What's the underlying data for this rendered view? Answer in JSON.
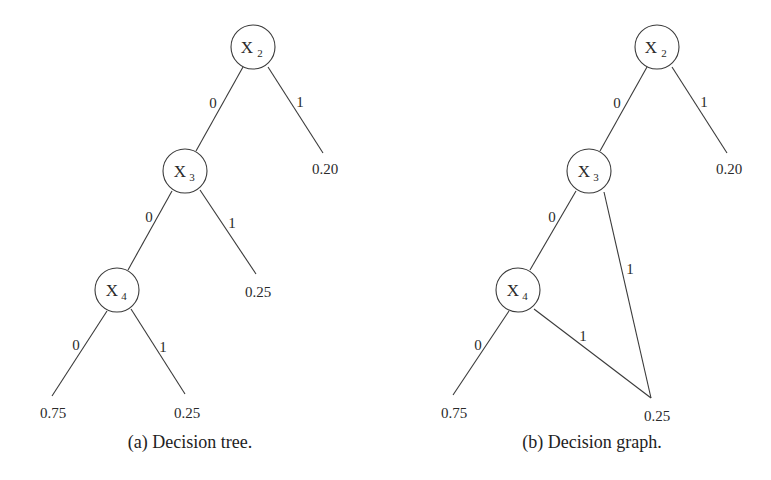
{
  "figures": [
    {
      "id": "a",
      "caption": "(a) Decision tree.",
      "nodes": [
        {
          "id": "X2",
          "var": "X",
          "sub": "2"
        },
        {
          "id": "X3",
          "var": "X",
          "sub": "3"
        },
        {
          "id": "X4",
          "var": "X",
          "sub": "4"
        }
      ],
      "edges": [
        {
          "from": "X2",
          "to": "X3",
          "label": "0"
        },
        {
          "from": "X2",
          "to": "leaf_0.20",
          "label": "1"
        },
        {
          "from": "X3",
          "to": "X4",
          "label": "0"
        },
        {
          "from": "X3",
          "to": "leaf_0.25a",
          "label": "1"
        },
        {
          "from": "X4",
          "to": "leaf_0.75",
          "label": "0"
        },
        {
          "from": "X4",
          "to": "leaf_0.25b",
          "label": "1"
        }
      ],
      "leaves": [
        "0.20",
        "0.25",
        "0.75",
        "0.25"
      ]
    },
    {
      "id": "b",
      "caption": "(b) Decision graph.",
      "nodes": [
        {
          "id": "X2",
          "var": "X",
          "sub": "2"
        },
        {
          "id": "X3",
          "var": "X",
          "sub": "3"
        },
        {
          "id": "X4",
          "var": "X",
          "sub": "4"
        }
      ],
      "edges": [
        {
          "from": "X2",
          "to": "X3",
          "label": "0"
        },
        {
          "from": "X2",
          "to": "leaf_0.20",
          "label": "1"
        },
        {
          "from": "X3",
          "to": "X4",
          "label": "0"
        },
        {
          "from": "X3",
          "to": "leaf_0.25",
          "label": "1"
        },
        {
          "from": "X4",
          "to": "leaf_0.75",
          "label": "0"
        },
        {
          "from": "X4",
          "to": "leaf_0.25",
          "label": "1"
        }
      ],
      "leaves": [
        "0.20",
        "0.75",
        "0.25"
      ]
    }
  ]
}
